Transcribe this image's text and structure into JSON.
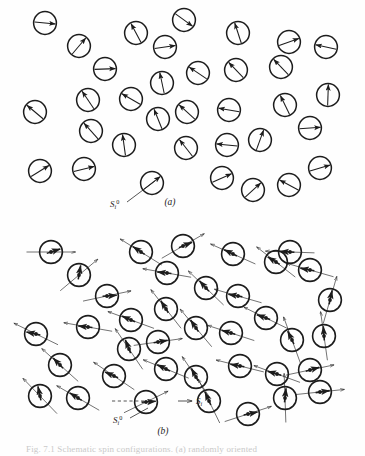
{
  "figure": {
    "kind": "physics-diagram",
    "background_color": "#fefefe",
    "ink_color": "#1c1c1c",
    "width": 365,
    "height": 456
  },
  "panels": [
    {
      "id": "a",
      "label": "(a)",
      "label_x": 170,
      "label_y": 205,
      "circle_radius": 11.4,
      "has_anisotropy_axes": false,
      "has_center_dot": false,
      "annotations": [
        {
          "name": "spin-label-s-i-zero",
          "base": "S",
          "sub": "i",
          "sup": "0",
          "x": 110,
          "y": 207,
          "leader": {
            "from_x": 127,
            "from_y": 202,
            "to_x": 155,
            "to_y": 181,
            "dashed": false
          }
        }
      ]
    },
    {
      "id": "b",
      "label": "(b)",
      "label_x": 163,
      "label_y": 434,
      "circle_radius": 11.4,
      "has_anisotropy_axes": true,
      "has_center_dot": true,
      "annotations": [
        {
          "name": "spin-label-s-i-zero",
          "base": "S",
          "sub": "i",
          "sup": "0",
          "x": 113,
          "y": 423,
          "leader": {
            "from_x": 130,
            "from_y": 418,
            "to_x": 148,
            "to_y": 408,
            "dashed": false
          }
        },
        {
          "name": "spin-label-s-i",
          "base": "S",
          "sub": "i",
          "sup": "",
          "x": 196,
          "y": 404,
          "leader": {
            "from_x": 178,
            "from_y": 401,
            "to_x": 192,
            "to_y": 401,
            "dashed": false
          }
        },
        {
          "name": "dashed-reference-line",
          "base": "",
          "sub": "",
          "sup": "",
          "x": 0,
          "y": 0,
          "leader": {
            "from_x": 112,
            "from_y": 401,
            "to_x": 144,
            "to_y": 401,
            "dashed": true
          }
        }
      ]
    }
  ],
  "caption": {
    "text": "Fig. 7.1  Schematic spin configurations. (a) randomly oriented",
    "visible": "partially-cropped"
  },
  "panel_a_particles": [
    {
      "cx": 45,
      "cy": 23,
      "angle": 5
    },
    {
      "cx": 79,
      "cy": 46,
      "angle": -50
    },
    {
      "cx": 105,
      "cy": 69,
      "angle": -2
    },
    {
      "cx": 136,
      "cy": 33,
      "angle": 242
    },
    {
      "cx": 165,
      "cy": 47,
      "angle": -8
    },
    {
      "cx": 184,
      "cy": 20,
      "angle": 36
    },
    {
      "cx": 162,
      "cy": 83,
      "angle": 258
    },
    {
      "cx": 198,
      "cy": 73,
      "angle": 214
    },
    {
      "cx": 238,
      "cy": 33,
      "angle": 252
    },
    {
      "cx": 236,
      "cy": 70,
      "angle": 226
    },
    {
      "cx": 289,
      "cy": 42,
      "angle": -20
    },
    {
      "cx": 326,
      "cy": 47,
      "angle": 192
    },
    {
      "cx": 281,
      "cy": 67,
      "angle": 226
    },
    {
      "cx": 285,
      "cy": 105,
      "angle": 244
    },
    {
      "cx": 328,
      "cy": 95,
      "angle": 272
    },
    {
      "cx": 88,
      "cy": 100,
      "angle": 236
    },
    {
      "cx": 131,
      "cy": 99,
      "angle": 210
    },
    {
      "cx": 158,
      "cy": 119,
      "angle": 248
    },
    {
      "cx": 35,
      "cy": 112,
      "angle": 220
    },
    {
      "cx": 91,
      "cy": 131,
      "angle": 228
    },
    {
      "cx": 124,
      "cy": 145,
      "angle": 262
    },
    {
      "cx": 187,
      "cy": 112,
      "angle": 222
    },
    {
      "cx": 186,
      "cy": 148,
      "angle": 232
    },
    {
      "cx": 229,
      "cy": 110,
      "angle": 190
    },
    {
      "cx": 227,
      "cy": 145,
      "angle": 186
    },
    {
      "cx": 260,
      "cy": 140,
      "angle": 290
    },
    {
      "cx": 310,
      "cy": 128,
      "angle": -4
    },
    {
      "cx": 40,
      "cy": 171,
      "angle": -32
    },
    {
      "cx": 84,
      "cy": 169,
      "angle": -14
    },
    {
      "cx": 152,
      "cy": 183,
      "angle": -38
    },
    {
      "cx": 222,
      "cy": 178,
      "angle": -24
    },
    {
      "cx": 253,
      "cy": 190,
      "angle": -42
    },
    {
      "cx": 289,
      "cy": 185,
      "angle": 208
    },
    {
      "cx": 320,
      "cy": 168,
      "angle": -16
    }
  ],
  "panel_b_particles": [
    {
      "cx": 51,
      "cy": 252,
      "spin": -18,
      "axis": 0
    },
    {
      "cx": 79,
      "cy": 275,
      "spin": -80,
      "axis": -40
    },
    {
      "cx": 107,
      "cy": 296,
      "spin": -4,
      "axis": -12
    },
    {
      "cx": 141,
      "cy": 252,
      "spin": 214,
      "axis": 212
    },
    {
      "cx": 167,
      "cy": 273,
      "spin": 186,
      "axis": 190
    },
    {
      "cx": 183,
      "cy": 246,
      "spin": -22,
      "axis": -30
    },
    {
      "cx": 166,
      "cy": 309,
      "spin": 238,
      "axis": 232
    },
    {
      "cx": 131,
      "cy": 320,
      "spin": 204,
      "axis": 200
    },
    {
      "cx": 206,
      "cy": 288,
      "spin": 228,
      "axis": 224
    },
    {
      "cx": 233,
      "cy": 254,
      "spin": 206,
      "axis": 204
    },
    {
      "cx": 238,
      "cy": 296,
      "spin": 190,
      "axis": 196
    },
    {
      "cx": 276,
      "cy": 262,
      "spin": 212,
      "axis": 218
    },
    {
      "cx": 310,
      "cy": 270,
      "spin": 190,
      "axis": 196
    },
    {
      "cx": 290,
      "cy": 252,
      "spin": 184,
      "axis": 182
    },
    {
      "cx": 330,
      "cy": 300,
      "spin": 282,
      "axis": 286
    },
    {
      "cx": 88,
      "cy": 327,
      "spin": 186,
      "axis": 190
    },
    {
      "cx": 36,
      "cy": 334,
      "spin": 192,
      "axis": 206
    },
    {
      "cx": 129,
      "cy": 349,
      "spin": 248,
      "axis": 236
    },
    {
      "cx": 158,
      "cy": 342,
      "spin": -10,
      "axis": -8
    },
    {
      "cx": 196,
      "cy": 328,
      "spin": 236,
      "axis": 230
    },
    {
      "cx": 231,
      "cy": 333,
      "spin": 196,
      "axis": 198
    },
    {
      "cx": 266,
      "cy": 318,
      "spin": 200,
      "axis": 206
    },
    {
      "cx": 292,
      "cy": 340,
      "spin": 244,
      "axis": 250
    },
    {
      "cx": 324,
      "cy": 336,
      "spin": 266,
      "axis": 262
    },
    {
      "cx": 114,
      "cy": 376,
      "spin": 204,
      "axis": 214
    },
    {
      "cx": 166,
      "cy": 369,
      "spin": 206,
      "axis": 202
    },
    {
      "cx": 196,
      "cy": 377,
      "spin": 242,
      "axis": 236
    },
    {
      "cx": 240,
      "cy": 366,
      "spin": 190,
      "axis": 194
    },
    {
      "cx": 277,
      "cy": 374,
      "spin": 196,
      "axis": 200
    },
    {
      "cx": 310,
      "cy": 370,
      "spin": -16,
      "axis": -12
    },
    {
      "cx": 40,
      "cy": 396,
      "spin": 258,
      "axis": 226
    },
    {
      "cx": 78,
      "cy": 398,
      "spin": 212,
      "axis": 210
    },
    {
      "cx": 146,
      "cy": 402,
      "spin": -4,
      "axis": -26
    },
    {
      "cx": 209,
      "cy": 401,
      "spin": 246,
      "axis": 244
    },
    {
      "cx": 248,
      "cy": 414,
      "spin": -12,
      "axis": -18
    },
    {
      "cx": 285,
      "cy": 398,
      "spin": 276,
      "axis": 268
    },
    {
      "cx": 320,
      "cy": 392,
      "spin": -8,
      "axis": -6
    },
    {
      "cx": 60,
      "cy": 365,
      "spin": 226,
      "axis": 222
    }
  ]
}
